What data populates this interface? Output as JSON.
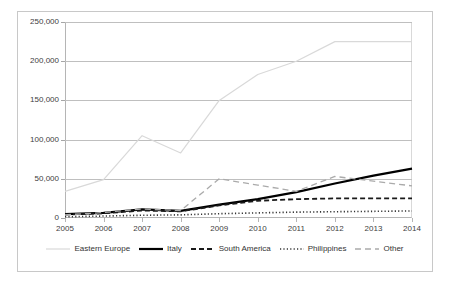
{
  "chart_data": {
    "type": "line",
    "title": "",
    "xlabel": "",
    "ylabel": "",
    "x": [
      2005,
      2006,
      2007,
      2008,
      2009,
      2010,
      2011,
      2012,
      2013,
      2014
    ],
    "xticklabels": [
      "2005",
      "2006",
      "2007",
      "2008",
      "2009",
      "2010",
      "2011",
      "2012",
      "2013",
      "2014"
    ],
    "yticks": [
      0,
      50000,
      100000,
      150000,
      200000,
      250000
    ],
    "yticklabels": [
      "0",
      "50,000",
      "100,000",
      "150,000",
      "200,000",
      "250,000"
    ],
    "ylim": [
      0,
      250000
    ],
    "grid": true,
    "legend_position": "bottom",
    "series": [
      {
        "name": "Eastern Europe",
        "style": "solid-light",
        "color": "#d9d9d9",
        "values": [
          34000,
          49000,
          105000,
          83000,
          150000,
          183000,
          200000,
          225000,
          225000,
          225000
        ]
      },
      {
        "name": "Italy",
        "style": "solid-thick",
        "color": "#000000",
        "values": [
          5000,
          6500,
          11000,
          9000,
          17000,
          24000,
          33000,
          44000,
          54000,
          63000
        ]
      },
      {
        "name": "South America",
        "style": "dashed",
        "color": "#1a1a1a",
        "values": [
          4500,
          6000,
          9500,
          8500,
          16000,
          22000,
          24000,
          25000,
          25000,
          25000
        ]
      },
      {
        "name": "Philippines",
        "style": "dotted",
        "color": "#333333",
        "values": [
          1500,
          2500,
          3500,
          4000,
          5500,
          6500,
          7500,
          8000,
          8500,
          9000
        ]
      },
      {
        "name": "Other",
        "style": "longdash-light",
        "color": "#aaaaaa",
        "values": [
          4000,
          7000,
          11500,
          9500,
          50000,
          42000,
          34000,
          53000,
          47000,
          41000
        ]
      }
    ]
  },
  "legend": {
    "items": [
      {
        "label": "Eastern Europe"
      },
      {
        "label": "Italy"
      },
      {
        "label": "South America"
      },
      {
        "label": "Philippines"
      },
      {
        "label": "Other"
      }
    ]
  }
}
